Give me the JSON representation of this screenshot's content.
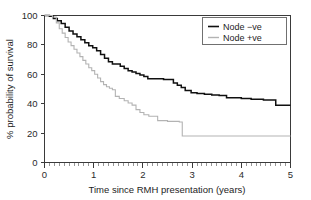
{
  "chart_data": {
    "type": "line",
    "title": "",
    "subtitle": "",
    "xlabel": "Time since RMH presentation (years)",
    "ylabel": "% probability of survival",
    "xlim": [
      0,
      5
    ],
    "ylim": [
      0,
      100
    ],
    "xticks": [
      0,
      1,
      2,
      3,
      4,
      5
    ],
    "xticklabels": [
      "0",
      "1",
      "2",
      "3",
      "4",
      "5"
    ],
    "yticks": [
      0,
      20,
      40,
      60,
      80,
      100
    ],
    "yticklabels": [
      "0",
      "20",
      "40",
      "60",
      "80",
      "100"
    ],
    "x_minor_tick_interval": 0.1,
    "grid": false,
    "legend_position": "top-right",
    "legend": [
      "Node −ve",
      "Node +ve"
    ],
    "colors": {
      "node_negative": "#101010",
      "node_positive": "#b3b3b3",
      "axis": "#3a3a3a",
      "background": "#ffffff"
    },
    "series": [
      {
        "name": "Node −ve",
        "color": "#101010",
        "style": "step-post",
        "x": [
          0.0,
          0.1,
          0.18,
          0.26,
          0.34,
          0.42,
          0.5,
          0.58,
          0.66,
          0.74,
          0.82,
          0.9,
          0.98,
          1.06,
          1.14,
          1.22,
          1.3,
          1.38,
          1.46,
          1.54,
          1.62,
          1.7,
          1.78,
          1.86,
          1.94,
          2.02,
          2.1,
          2.18,
          2.3,
          2.42,
          2.54,
          2.62,
          2.7,
          2.78,
          2.86,
          2.98,
          3.1,
          3.25,
          3.4,
          3.55,
          3.7,
          3.85,
          4.0,
          4.2,
          4.45,
          4.7,
          5.0
        ],
        "y": [
          100.0,
          99.5,
          98.0,
          96.5,
          94.5,
          92.0,
          89.5,
          87.5,
          85.5,
          83.5,
          81.5,
          79.5,
          78.0,
          76.0,
          73.5,
          71.0,
          68.5,
          67.0,
          67.0,
          65.5,
          64.0,
          62.5,
          61.5,
          60.5,
          59.5,
          58.5,
          57.0,
          57.0,
          57.0,
          56.5,
          56.5,
          54.0,
          52.5,
          51.0,
          49.0,
          47.5,
          47.0,
          46.5,
          46.0,
          45.5,
          44.0,
          44.0,
          43.5,
          43.0,
          42.5,
          39.0,
          39.0
        ]
      },
      {
        "name": "Node +ve",
        "color": "#b3b3b3",
        "style": "step-post",
        "x": [
          0.0,
          0.16,
          0.24,
          0.3,
          0.36,
          0.42,
          0.48,
          0.54,
          0.6,
          0.66,
          0.72,
          0.78,
          0.84,
          0.9,
          0.96,
          1.02,
          1.08,
          1.14,
          1.2,
          1.26,
          1.32,
          1.38,
          1.44,
          1.52,
          1.62,
          1.7,
          1.78,
          1.86,
          1.94,
          2.02,
          2.12,
          2.3,
          2.5,
          2.68,
          2.74,
          2.8,
          3.2,
          3.8,
          4.4,
          5.0
        ],
        "y": [
          100.0,
          99.0,
          95.0,
          91.0,
          88.0,
          85.0,
          82.0,
          79.5,
          77.0,
          74.5,
          72.0,
          69.5,
          67.0,
          64.5,
          62.5,
          60.0,
          57.5,
          55.0,
          53.0,
          51.5,
          50.5,
          49.5,
          45.0,
          43.5,
          42.0,
          40.5,
          39.0,
          36.0,
          34.0,
          32.5,
          31.5,
          28.5,
          28.0,
          28.0,
          27.5,
          18.0,
          18.0,
          18.0,
          18.0,
          18.0
        ]
      }
    ]
  },
  "figure": {
    "xlabel": "Time since RMH presentation (years)",
    "ylabel": "% probability of survival",
    "legend_items": [
      {
        "label": "Node −ve"
      },
      {
        "label": "Node +ve"
      }
    ]
  }
}
